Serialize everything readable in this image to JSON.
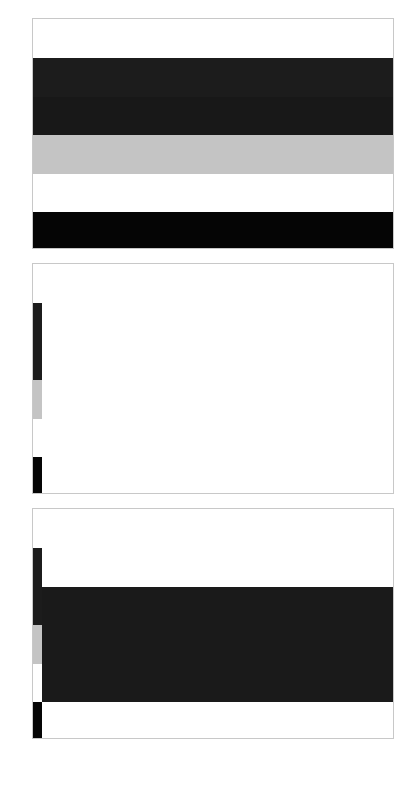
{
  "colors": {
    "white": "#ffffff",
    "dark": "#1c1c1c",
    "darker": "#181818",
    "gray": "#c4c4c4",
    "black": "#050505",
    "border": "#c8c8c8"
  },
  "panels": [
    {
      "name": "panel-full-stripes",
      "bands": [
        "white",
        "dark",
        "darker",
        "gray",
        "white",
        "black"
      ]
    },
    {
      "name": "panel-left-strip-only",
      "strip_bands": [
        "white",
        "dark",
        "darker",
        "gray",
        "white",
        "black"
      ]
    },
    {
      "name": "panel-left-strip-with-dark-block",
      "strip_bands": [
        "white",
        "dark",
        "darker",
        "gray",
        "white",
        "black"
      ],
      "block_color": "dark"
    }
  ]
}
